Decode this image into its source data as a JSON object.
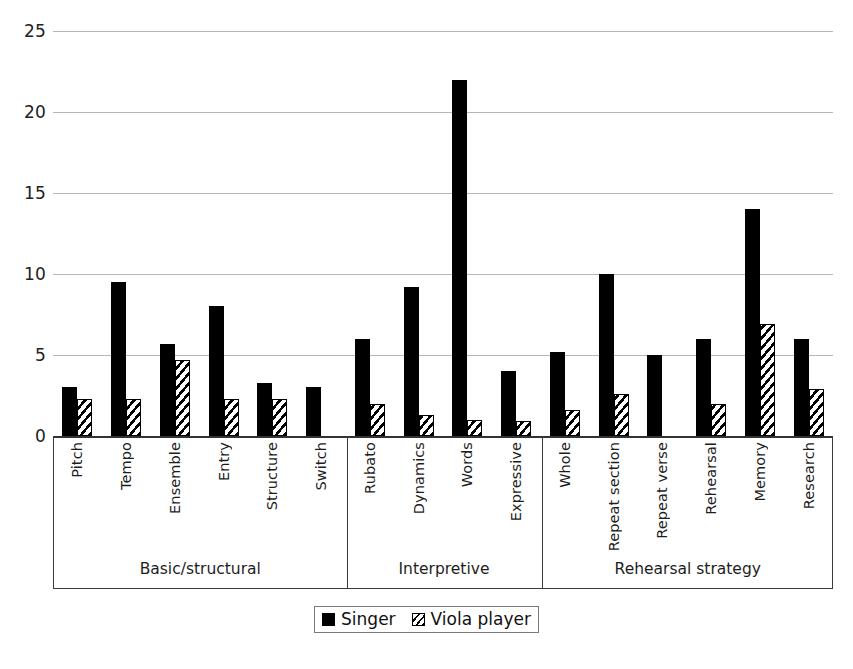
{
  "chart_data": {
    "type": "bar",
    "title": "",
    "xlabel": "",
    "ylabel": "",
    "ylim": [
      0,
      25
    ],
    "yticks": [
      0,
      5,
      10,
      15,
      20,
      25
    ],
    "grid": true,
    "legend_position": "bottom",
    "categories": [
      "Pitch",
      "Tempo",
      "Ensemble",
      "Entry",
      "Structure",
      "Switch",
      "Rubato",
      "Dynamics",
      "Words",
      "Expressive",
      "Whole",
      "Repeat section",
      "Repeat verse",
      "Rehearsal",
      "Memory",
      "Research"
    ],
    "series": [
      {
        "name": "Singer",
        "style": "solid-black",
        "color": "#000000",
        "values": [
          3.0,
          9.5,
          5.7,
          8.0,
          3.3,
          3.0,
          6.0,
          9.2,
          22.0,
          4.0,
          5.2,
          10.0,
          5.0,
          6.0,
          14.0,
          6.0
        ]
      },
      {
        "name": "Viola player",
        "style": "diagonal-hatch",
        "color": "#ffffff",
        "values": [
          2.3,
          2.3,
          4.7,
          2.3,
          2.3,
          0,
          2.0,
          1.3,
          1.0,
          0.9,
          1.6,
          2.6,
          0,
          2.0,
          6.9,
          2.9
        ]
      }
    ],
    "groups": [
      {
        "label": "Basic/structural",
        "categories": [
          "Pitch",
          "Tempo",
          "Ensemble",
          "Entry",
          "Structure",
          "Switch"
        ]
      },
      {
        "label": "Interpretive",
        "categories": [
          "Rubato",
          "Dynamics",
          "Words",
          "Expressive"
        ]
      },
      {
        "label": "Rehearsal strategy",
        "categories": [
          "Whole",
          "Repeat section",
          "Repeat verse",
          "Rehearsal",
          "Memory",
          "Research"
        ]
      }
    ]
  },
  "axis": {
    "y_ticks": [
      "25",
      "20",
      "15",
      "10",
      "5",
      "0"
    ]
  },
  "groups": {
    "g0_label": "Basic/structural",
    "g1_label": "Interpretive",
    "g2_label": "Rehearsal strategy"
  },
  "categories": {
    "c0": "Pitch",
    "c1": "Tempo",
    "c2": "Ensemble",
    "c3": "Entry",
    "c4": "Structure",
    "c5": "Switch",
    "c6": "Rubato",
    "c7": "Dynamics",
    "c8": "Words",
    "c9": "Expressive",
    "c10": "Whole",
    "c11": "Repeat section",
    "c12": "Repeat verse",
    "c13": "Rehearsal",
    "c14": "Memory",
    "c15": "Research"
  },
  "legend": {
    "singer": "Singer",
    "viola": "Viola player"
  }
}
